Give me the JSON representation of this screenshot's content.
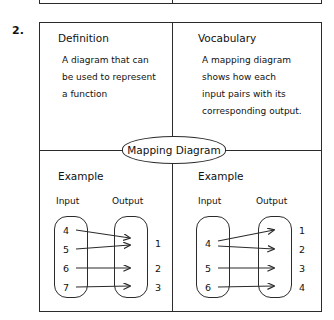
{
  "worksheet": {
    "item_number": "2.",
    "center_term": "Mapping Diagram"
  },
  "quadrants": {
    "definition": {
      "title": "Definition",
      "lines": [
        "A diagram that can",
        "be used to represent",
        "a function"
      ]
    },
    "vocabulary": {
      "title": "Vocabulary",
      "lines": [
        "A mapping diagram",
        "shows how each",
        "input pairs with its",
        "corresponding output."
      ]
    },
    "example_left": {
      "title": "Example"
    },
    "example_right": {
      "title": "Example"
    }
  },
  "diagrams": [
    {
      "name": "example-left",
      "input_header": "Input",
      "output_header": "Output",
      "inputs": [
        "4",
        "5",
        "6",
        "7"
      ],
      "outputs": [
        "1",
        "1",
        "2",
        "3"
      ],
      "mappings": [
        {
          "from": "4",
          "to": "1"
        },
        {
          "from": "5",
          "to": "1"
        },
        {
          "from": "6",
          "to": "2"
        },
        {
          "from": "7",
          "to": "3"
        }
      ]
    },
    {
      "name": "example-right",
      "input_header": "Input",
      "output_header": "Output",
      "inputs": [
        "4",
        "5",
        "6"
      ],
      "outputs": [
        "1",
        "2",
        "3",
        "4"
      ],
      "mappings": [
        {
          "from": "4",
          "to": "1"
        },
        {
          "from": "4",
          "to": "2"
        },
        {
          "from": "5",
          "to": "3"
        },
        {
          "from": "6",
          "to": "4"
        }
      ]
    }
  ],
  "colors": {
    "ink": "#2b2b2b",
    "paper": "#ffffff"
  }
}
